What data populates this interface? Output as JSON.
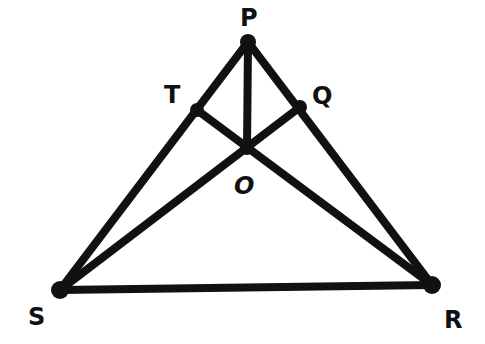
{
  "diagram": {
    "type": "geometry-triangle",
    "stroke_color": "#111111",
    "background": "#ffffff",
    "points": {
      "P": {
        "label": "P"
      },
      "Q": {
        "label": "Q"
      },
      "R": {
        "label": "R"
      },
      "S": {
        "label": "S"
      },
      "T": {
        "label": "T"
      },
      "O": {
        "label": "O"
      }
    },
    "segments": [
      [
        "P",
        "S"
      ],
      [
        "P",
        "R"
      ],
      [
        "S",
        "R"
      ],
      [
        "S",
        "Q"
      ],
      [
        "R",
        "T"
      ],
      [
        "P",
        "O"
      ]
    ]
  }
}
